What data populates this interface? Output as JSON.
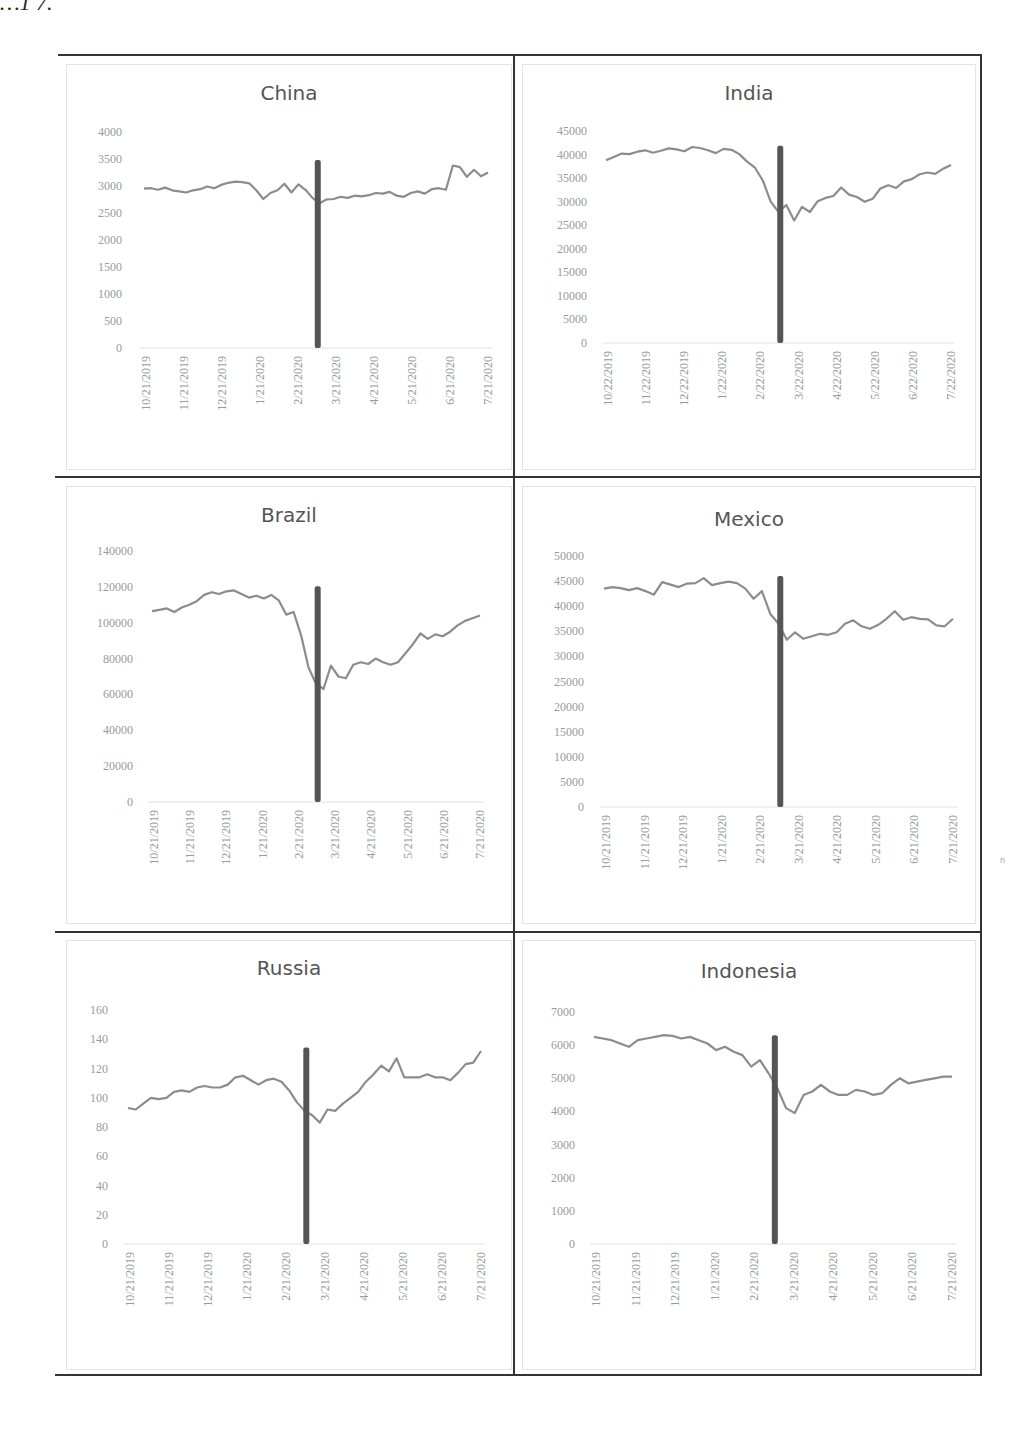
{
  "page": {
    "fragment_text": "…1 7.",
    "side_mark": "n"
  },
  "chart_data": [
    {
      "type": "line",
      "title": "China",
      "xlabel": "",
      "ylabel": "",
      "ylim": [
        0,
        4000
      ],
      "yticks": [
        0,
        500,
        1000,
        1500,
        2000,
        2500,
        3000,
        3500,
        4000
      ],
      "x_tick_labels": [
        "10/21/2019",
        "11/21/2019",
        "12/21/2019",
        "1/21/2020",
        "2/21/2020",
        "3/21/2020",
        "4/21/2020",
        "5/21/2020",
        "6/21/2020",
        "7/21/2020"
      ],
      "vertical_marker": {
        "x_position": "~3/11/2020",
        "color": "#555555"
      },
      "series": [
        {
          "name": "China",
          "color": "#8c8c8c",
          "values": [
            2950,
            2960,
            2930,
            2970,
            2920,
            2900,
            2880,
            2920,
            2940,
            2990,
            2960,
            3020,
            3060,
            3080,
            3070,
            3050,
            2920,
            2760,
            2870,
            2920,
            3040,
            2880,
            3030,
            2930,
            2780,
            2680,
            2750,
            2760,
            2800,
            2780,
            2820,
            2810,
            2830,
            2870,
            2860,
            2890,
            2820,
            2800,
            2870,
            2900,
            2860,
            2940,
            2960,
            2930,
            3380,
            3350,
            3170,
            3300,
            3180,
            3250
          ]
        }
      ],
      "grid": false,
      "legend": "none"
    },
    {
      "type": "line",
      "title": "India",
      "xlabel": "",
      "ylabel": "",
      "ylim": [
        0,
        45000
      ],
      "yticks": [
        0,
        5000,
        10000,
        15000,
        20000,
        25000,
        30000,
        35000,
        40000,
        45000
      ],
      "x_tick_labels": [
        "10/22/2019",
        "11/22/2019",
        "12/22/2019",
        "1/22/2020",
        "2/22/2020",
        "3/22/2020",
        "4/22/2020",
        "5/22/2020",
        "6/22/2020",
        "7/22/2020"
      ],
      "vertical_marker": {
        "x_position": "~3/11/2020",
        "color": "#555555"
      },
      "series": [
        {
          "name": "India",
          "color": "#8c8c8c",
          "values": [
            38800,
            39500,
            40200,
            40100,
            40600,
            40900,
            40400,
            40800,
            41300,
            41100,
            40700,
            41600,
            41400,
            40900,
            40300,
            41200,
            41000,
            40100,
            38500,
            37200,
            34500,
            30000,
            27800,
            29300,
            26000,
            28900,
            27800,
            30100,
            30800,
            31200,
            33000,
            31500,
            31000,
            30000,
            30600,
            32800,
            33500,
            32900,
            34300,
            34800,
            35800,
            36200,
            35900,
            37000,
            37800
          ]
        }
      ],
      "grid": false,
      "legend": "none"
    },
    {
      "type": "line",
      "title": "Brazil",
      "xlabel": "",
      "ylabel": "",
      "ylim": [
        0,
        140000
      ],
      "yticks": [
        0,
        20000,
        40000,
        60000,
        80000,
        100000,
        120000,
        140000
      ],
      "x_tick_labels": [
        "10/21/2019",
        "11/21/2019",
        "12/21/2019",
        "1/21/2020",
        "2/21/2020",
        "3/21/2020",
        "4/21/2020",
        "5/21/2020",
        "6/21/2020",
        "7/21/2020"
      ],
      "vertical_marker": {
        "x_position": "~3/11/2020",
        "color": "#555555"
      },
      "series": [
        {
          "name": "Brazil",
          "color": "#8c8c8c",
          "values": [
            106500,
            107200,
            108000,
            106000,
            108500,
            110000,
            112000,
            115500,
            117000,
            116000,
            117500,
            118000,
            116000,
            114000,
            115000,
            113500,
            115500,
            112500,
            104500,
            106000,
            93000,
            75000,
            66000,
            63000,
            76000,
            70000,
            69000,
            76500,
            78000,
            77000,
            80000,
            78000,
            76500,
            78000,
            83000,
            88000,
            94000,
            91000,
            93500,
            92500,
            95000,
            98500,
            101000,
            102500,
            104000
          ]
        }
      ],
      "grid": false,
      "legend": "none"
    },
    {
      "type": "line",
      "title": "Mexico",
      "xlabel": "",
      "ylabel": "",
      "ylim": [
        0,
        50000
      ],
      "yticks": [
        0,
        5000,
        10000,
        15000,
        20000,
        25000,
        30000,
        35000,
        40000,
        45000,
        50000
      ],
      "x_tick_labels": [
        "10/21/2019",
        "11/21/2019",
        "12/21/2019",
        "1/21/2020",
        "2/21/2020",
        "3/21/2020",
        "4/21/2020",
        "5/21/2020",
        "6/21/2020",
        "7/21/2020"
      ],
      "vertical_marker": {
        "x_position": "~3/11/2020",
        "color": "#555555"
      },
      "series": [
        {
          "name": "Mexico",
          "color": "#8c8c8c",
          "values": [
            43500,
            43800,
            43600,
            43200,
            43600,
            43000,
            42300,
            44800,
            44300,
            43800,
            44500,
            44600,
            45600,
            44200,
            44600,
            44900,
            44600,
            43500,
            41500,
            43000,
            38500,
            36500,
            33300,
            34800,
            33500,
            34000,
            34500,
            34300,
            34800,
            36500,
            37200,
            36000,
            35500,
            36300,
            37500,
            39000,
            37300,
            37800,
            37500,
            37400,
            36200,
            36000,
            37500
          ]
        }
      ],
      "grid": false,
      "legend": "none"
    },
    {
      "type": "line",
      "title": "Russia",
      "xlabel": "",
      "ylabel": "",
      "ylim": [
        0,
        160
      ],
      "yticks": [
        0,
        20,
        40,
        60,
        80,
        100,
        120,
        140,
        160
      ],
      "x_tick_labels": [
        "10/21/2019",
        "11/21/2019",
        "12/21/2019",
        "1/21/2020",
        "2/21/2020",
        "3/21/2020",
        "4/21/2020",
        "5/21/2020",
        "6/21/2020",
        "7/21/2020"
      ],
      "vertical_marker": {
        "x_position": "~3/11/2020",
        "color": "#555555"
      },
      "series": [
        {
          "name": "Russia",
          "color": "#8c8c8c",
          "values": [
            93,
            92,
            96,
            100,
            99,
            100,
            104,
            105,
            104,
            107,
            108,
            107,
            107,
            109,
            114,
            115,
            112,
            109,
            112,
            113,
            111,
            105,
            97,
            91,
            88,
            83,
            92,
            91,
            96,
            100,
            104,
            111,
            116,
            122,
            118,
            127,
            114,
            114,
            114,
            116,
            114,
            114,
            112,
            117,
            123,
            124,
            132
          ]
        }
      ],
      "grid": false,
      "legend": "none"
    },
    {
      "type": "line",
      "title": "Indonesia",
      "xlabel": "",
      "ylabel": "",
      "ylim": [
        0,
        7000
      ],
      "yticks": [
        0,
        1000,
        2000,
        3000,
        4000,
        5000,
        6000,
        7000
      ],
      "x_tick_labels": [
        "10/21/2019",
        "11/21/2019",
        "12/21/2019",
        "1/21/2020",
        "2/21/2020",
        "3/21/2020",
        "4/21/2020",
        "5/21/2020",
        "6/21/2020",
        "7/21/2020"
      ],
      "vertical_marker": {
        "x_position": "~3/11/2020",
        "color": "#555555"
      },
      "series": [
        {
          "name": "Indonesia",
          "color": "#8c8c8c",
          "values": [
            6250,
            6200,
            6150,
            6050,
            5950,
            6150,
            6200,
            6250,
            6300,
            6280,
            6200,
            6250,
            6150,
            6050,
            5850,
            5950,
            5800,
            5700,
            5350,
            5550,
            5150,
            4700,
            4100,
            3950,
            4500,
            4600,
            4800,
            4600,
            4500,
            4500,
            4650,
            4600,
            4500,
            4550,
            4800,
            5000,
            4850,
            4900,
            4950,
            5000,
            5050,
            5050
          ]
        }
      ],
      "grid": false,
      "legend": "none"
    }
  ]
}
